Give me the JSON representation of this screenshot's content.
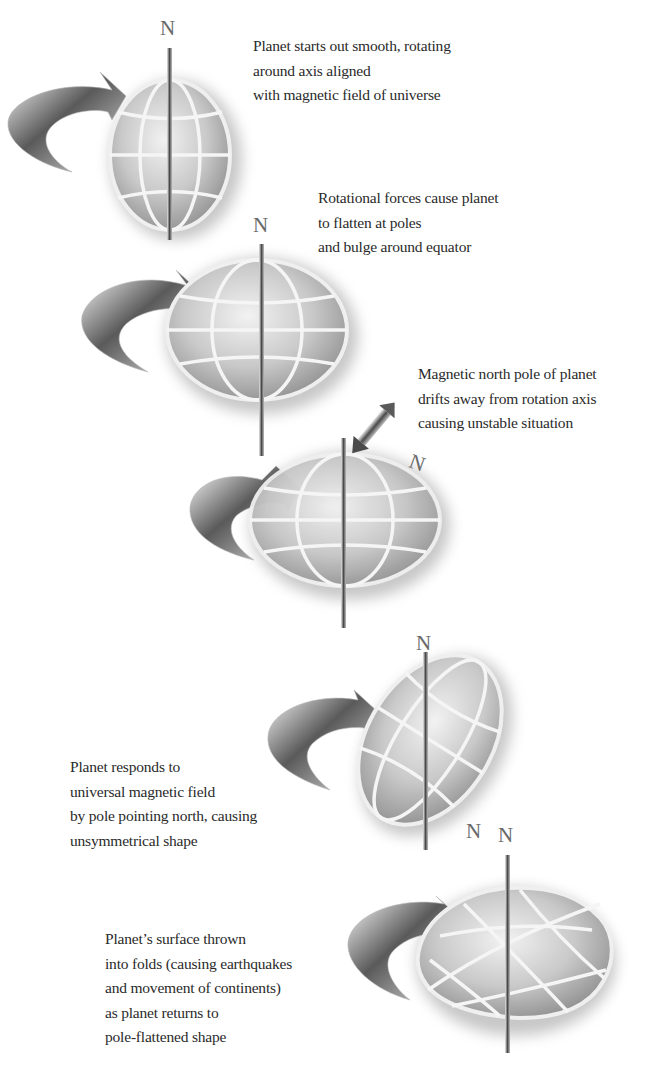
{
  "diagram": {
    "title_fragment": "",
    "pole_label": "N",
    "stages": [
      {
        "id": 1,
        "shape": "sphere",
        "lines": [
          "Planet starts out smooth, rotating",
          "around axis aligned",
          "with magnetic field of universe"
        ]
      },
      {
        "id": 2,
        "shape": "oblate",
        "lines": [
          "Rotational forces cause planet",
          "to flatten at poles",
          "and bulge around equator"
        ]
      },
      {
        "id": 3,
        "shape": "oblate-drifting-pole",
        "lines": [
          "Magnetic north pole of planet",
          "drifts away from rotation axis",
          "causing unstable situation"
        ]
      },
      {
        "id": 4,
        "shape": "tilted-unsymmetrical",
        "lines": [
          "Planet responds to",
          "universal magnetic field",
          "by pole pointing north, causing",
          "unsymmetrical shape"
        ]
      },
      {
        "id": 5,
        "shape": "folded-oblate",
        "lines": [
          "Planet’s surface thrown",
          "into folds (causing earthquakes",
          "and movement of continents)",
          "as planet returns to",
          "pole-flattened shape"
        ]
      }
    ]
  },
  "colors": {
    "background": "#ffffff",
    "text": "#2a2a2a",
    "globe_fill": "#c8c8c8",
    "grid": "#f4f4f4",
    "shadow": "#8a8a8a",
    "axis": "#555555"
  }
}
